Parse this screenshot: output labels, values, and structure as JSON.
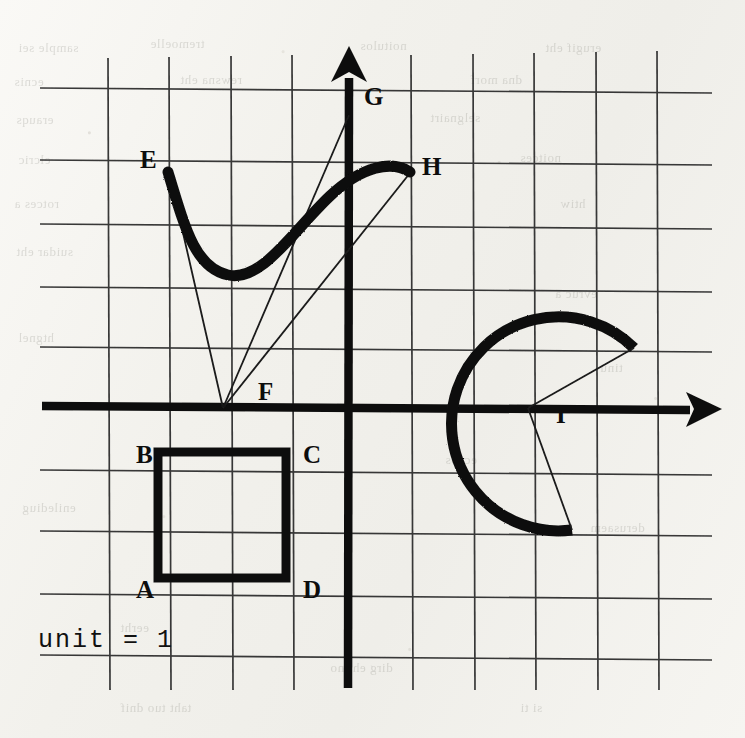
{
  "figure": {
    "caption": "unit = 1",
    "colors": {
      "ink": "#101010",
      "grid": "#2a2a2a",
      "paper": "#f4f3ef"
    },
    "axes": {
      "x_axis_label": "x-axis",
      "y_axis_label": "y-axis",
      "origin_px": [
        348,
        408
      ],
      "unit_px": 62,
      "grid_spacing_px": 62
    },
    "point_labels": [
      {
        "id": "A",
        "text": "A",
        "x": 136,
        "y": 598,
        "point_x": 158,
        "point_y": 578
      },
      {
        "id": "B",
        "text": "B",
        "x": 136,
        "y": 463,
        "point_x": 158,
        "point_y": 453
      },
      {
        "id": "C",
        "text": "C",
        "x": 303,
        "y": 463,
        "point_x": 285,
        "point_y": 453
      },
      {
        "id": "D",
        "text": "D",
        "x": 303,
        "y": 598,
        "point_x": 285,
        "point_y": 578
      },
      {
        "id": "E",
        "text": "E",
        "x": 140,
        "y": 168,
        "point_x": 168,
        "point_y": 172
      },
      {
        "id": "F",
        "text": "F",
        "x": 258,
        "y": 400,
        "point_x": 222,
        "point_y": 408
      },
      {
        "id": "G",
        "text": "G",
        "x": 364,
        "y": 105,
        "point_x": 348,
        "point_y": 114
      },
      {
        "id": "H",
        "text": "H",
        "x": 422,
        "y": 175,
        "point_x": 410,
        "point_y": 172
      },
      {
        "id": "I",
        "text": "I",
        "x": 556,
        "y": 423,
        "point_x": 528,
        "point_y": 408
      }
    ],
    "shapes": [
      {
        "name": "square-ABCD",
        "type": "square",
        "vertices": "A(-3,-3) B(-3,-1) C(-1,-1) D(-1,-3)",
        "side_units": 2
      },
      {
        "name": "curve-EH",
        "type": "cubic-s-curve",
        "from": "E",
        "to": "H"
      },
      {
        "name": "triangle-EFG",
        "type": "thin-triangle",
        "vertices": "E F G"
      },
      {
        "name": "segment-FH",
        "type": "thin-line",
        "from": "F",
        "to": "H"
      },
      {
        "name": "arc-sector-I",
        "type": "arc",
        "center": "I",
        "radius_units": 1.7,
        "start_angle_deg": 50,
        "sweep_deg": 275
      }
    ],
    "bleed_text": [
      {
        "text": "sample sei",
        "x": 18,
        "y": 40
      },
      {
        "text": "tremoelle",
        "x": 150,
        "y": 36
      },
      {
        "text": "noitulos",
        "x": 360,
        "y": 38
      },
      {
        "text": "erugif eht",
        "x": 545,
        "y": 40
      },
      {
        "text": "ecnis",
        "x": 14,
        "y": 74
      },
      {
        "text": "rewsna eht",
        "x": 180,
        "y": 72
      },
      {
        "text": "dna morf",
        "x": 470,
        "y": 72
      },
      {
        "text": "erauqs",
        "x": 16,
        "y": 112
      },
      {
        "text": "selgnairt",
        "x": 430,
        "y": 110
      },
      {
        "text": "elcric",
        "x": 18,
        "y": 152
      },
      {
        "text": "noitces",
        "x": 520,
        "y": 150
      },
      {
        "text": "rotces a",
        "x": 14,
        "y": 196
      },
      {
        "text": "htiw",
        "x": 560,
        "y": 196
      },
      {
        "text": "suidar eht",
        "x": 16,
        "y": 244
      },
      {
        "text": "evruc a",
        "x": 555,
        "y": 286
      },
      {
        "text": "htgnel",
        "x": 18,
        "y": 330
      },
      {
        "text": "tinu",
        "x": 600,
        "y": 360
      },
      {
        "text": "ecaps",
        "x": 445,
        "y": 452
      },
      {
        "text": "enilediug",
        "x": 22,
        "y": 500
      },
      {
        "text": "derusaem",
        "x": 590,
        "y": 520
      },
      {
        "text": "eerht",
        "x": 120,
        "y": 620
      },
      {
        "text": "dirg eht no",
        "x": 330,
        "y": 660
      },
      {
        "text": "taht tuo dnif",
        "x": 120,
        "y": 700
      },
      {
        "text": "si ti",
        "x": 520,
        "y": 700
      }
    ]
  }
}
